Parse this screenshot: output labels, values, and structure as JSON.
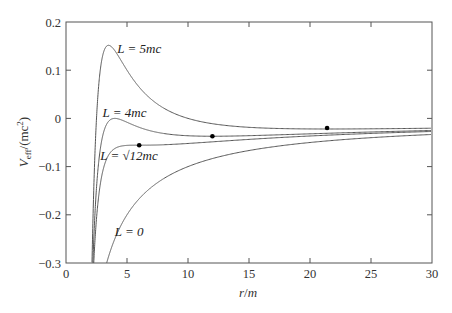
{
  "chart_data": {
    "type": "line",
    "title": "",
    "xlabel": "r/m",
    "ylabel": "V_eff/(mc^2)",
    "xlim": [
      0,
      30
    ],
    "ylim": [
      -0.3,
      0.2
    ],
    "grid": false,
    "x_ticks": [
      "0",
      "5",
      "10",
      "15",
      "20",
      "25",
      "30"
    ],
    "y_ticks": [
      "−0.3",
      "−0.2",
      "−0.1",
      "0",
      "0.1",
      "0.2"
    ],
    "formula": "V_eff/(mc^2) = -1/r + l^2/(2 r^2) - l^2/r^3, with l = L/(mc) in units of m",
    "series": [
      {
        "name": "L = 5mc",
        "l": 5,
        "label_text": "L = 5mc",
        "label_pos": [
          4.2,
          0.145
        ],
        "points": [
          [
            2.2,
            -0.3
          ],
          [
            2.6,
            -0.035
          ],
          [
            3.0,
            0.093
          ],
          [
            3.6,
            0.151
          ],
          [
            4.5,
            0.129
          ],
          [
            6,
            0.065
          ],
          [
            8,
            0.018
          ],
          [
            12,
            -0.008
          ],
          [
            16,
            -0.019
          ],
          [
            21.4,
            -0.02
          ],
          [
            30,
            -0.02
          ]
        ]
      },
      {
        "name": "L = 4mc",
        "l": 4,
        "label_text": "L = 4mc",
        "label_pos": [
          3.0,
          0.012
        ],
        "points": [
          [
            2.2,
            -0.3
          ],
          [
            2.6,
            -0.117
          ],
          [
            3.0,
            -0.037
          ],
          [
            4.0,
            0.0
          ],
          [
            5.0,
            -0.008
          ],
          [
            7,
            -0.027
          ],
          [
            12,
            -0.037
          ],
          [
            20,
            -0.032
          ],
          [
            30,
            -0.026
          ]
        ]
      },
      {
        "name": "L = √12mc",
        "l": 3.4641,
        "label_text": "L = √12mc",
        "label_pos": [
          2.8,
          -0.077
        ],
        "points": [
          [
            2.2,
            -0.3
          ],
          [
            2.6,
            -0.164
          ],
          [
            3.0,
            -0.111
          ],
          [
            4.0,
            -0.0625
          ],
          [
            6.0,
            -0.0556
          ],
          [
            10,
            -0.054
          ],
          [
            20,
            -0.04
          ],
          [
            30,
            -0.03
          ]
        ]
      },
      {
        "name": "L = 0",
        "l": 0,
        "label_text": "L = 0",
        "label_pos": [
          4.0,
          -0.235
        ],
        "points": [
          [
            3.33,
            -0.3
          ],
          [
            4,
            -0.25
          ],
          [
            5,
            -0.2
          ],
          [
            7,
            -0.143
          ],
          [
            10,
            -0.1
          ],
          [
            15,
            -0.067
          ],
          [
            20,
            -0.05
          ],
          [
            30,
            -0.033
          ]
        ]
      }
    ],
    "markers": [
      {
        "series": "L = √12mc",
        "x": 6.0,
        "y": -0.0556
      },
      {
        "series": "L = 4mc",
        "x": 12.0,
        "y": -0.037
      },
      {
        "series": "L = 5mc",
        "x": 21.4,
        "y": -0.02
      }
    ]
  },
  "axis": {
    "xlabel_r": "r",
    "xlabel_slash": "/",
    "xlabel_m": "m",
    "ylabel_V": "V",
    "ylabel_sub": "eff",
    "ylabel_rest": "/(mc",
    "ylabel_sup": "2",
    "ylabel_close": ")"
  }
}
